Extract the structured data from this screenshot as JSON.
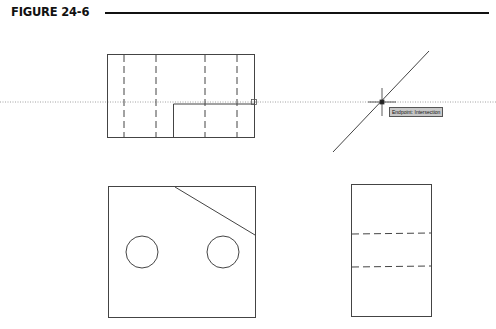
{
  "figure": {
    "title": "FIGURE 24-6"
  },
  "tooltip": {
    "text": "Endpoint: Intersection"
  },
  "colors": {
    "line": "#444444",
    "tracking_line": "#888888",
    "tooltip_bg": "#c8c8c8"
  },
  "views": [
    {
      "name": "top-view",
      "description": "rectangle with four vertical hidden lines and an inner notch rectangle"
    },
    {
      "name": "miter-line",
      "description": "45-degree construction line with tracking intersection"
    },
    {
      "name": "front-view",
      "description": "rectangle with chamfered corner line and two circular holes"
    },
    {
      "name": "side-view",
      "description": "rectangle with two horizontal hidden lines"
    }
  ]
}
